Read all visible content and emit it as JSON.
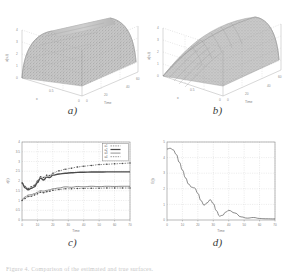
{
  "figure": {
    "background": "#ffffff",
    "caption": "Figure 4. Comparison of the estimated and true surfaces.",
    "panels": [
      "a)",
      "b)",
      "c)",
      "d)"
    ]
  },
  "colors": {
    "axis": "#8a8a8a",
    "grid": "#c9c9c9",
    "surface_dark": "#6e6e6e",
    "surface_light": "#b5b5b5",
    "mesh": "#555555",
    "curve": "#4a4a4a",
    "text": "#5a5a5a"
  },
  "chart_data": [
    {
      "id": "a",
      "type": "surface",
      "label": "a)",
      "title": "",
      "xlabel": "x",
      "ylabel": "Time",
      "zlabel": "u(x,t)",
      "xlim": [
        0,
        1
      ],
      "ylim": [
        0,
        60
      ],
      "zlim": [
        0,
        4
      ],
      "xticks": [
        "0",
        "0.5",
        "1"
      ],
      "yticks": [
        "0",
        "20",
        "40",
        "60"
      ],
      "zticks": [
        "0",
        "1",
        "2",
        "3",
        "4"
      ],
      "grid": true,
      "render": "shaded-noisy-surface",
      "description": "Rough speckled ridge surface, arch shaped along x, flat along time"
    },
    {
      "id": "b",
      "type": "surface",
      "label": "b)",
      "title": "",
      "xlabel": "x",
      "ylabel": "Time",
      "zlabel": "u(x,t)",
      "xlim": [
        0,
        1
      ],
      "ylim": [
        0,
        60
      ],
      "zlim": [
        0,
        4
      ],
      "xticks": [
        "0",
        "0.5",
        "1"
      ],
      "yticks": [
        "0",
        "20",
        "40",
        "60"
      ],
      "zticks": [
        "0",
        "1",
        "2",
        "3",
        "4"
      ],
      "grid": true,
      "render": "wireframe-surface",
      "description": "Smooth mesh surface rising from zero near the origin to a rounded ridge"
    },
    {
      "id": "c",
      "type": "line",
      "label": "c)",
      "title": "",
      "xlabel": "Time",
      "ylabel": "a(t)",
      "xlim": [
        0,
        70
      ],
      "ylim": [
        0,
        4
      ],
      "xticks": [
        0,
        10,
        20,
        30,
        40,
        50,
        60,
        70
      ],
      "yticks": [
        0,
        0.5,
        1,
        1.5,
        2,
        2.5,
        3,
        3.5,
        4
      ],
      "grid": true,
      "legend_position": "top-right",
      "legend": [
        "a1",
        "a2",
        "a3",
        "a4"
      ],
      "series": [
        {
          "name": "a1",
          "style": "marker-dotted",
          "x": [
            0,
            2,
            4,
            6,
            8,
            10,
            12,
            14,
            16,
            18,
            20,
            24,
            28,
            32,
            36,
            40,
            45,
            50,
            55,
            60,
            65,
            70
          ],
          "values": [
            1.9,
            1.72,
            1.62,
            1.7,
            1.78,
            2.0,
            2.22,
            2.18,
            2.3,
            2.28,
            2.4,
            2.52,
            2.6,
            2.66,
            2.72,
            2.76,
            2.8,
            2.84,
            2.86,
            2.88,
            2.9,
            2.92
          ]
        },
        {
          "name": "a2",
          "style": "thick-solid",
          "x": [
            0,
            2,
            4,
            6,
            8,
            10,
            12,
            14,
            16,
            18,
            20,
            24,
            28,
            32,
            36,
            40,
            45,
            50,
            55,
            60,
            65,
            70
          ],
          "values": [
            1.9,
            1.65,
            1.55,
            1.62,
            1.7,
            1.92,
            2.15,
            2.05,
            2.2,
            2.18,
            2.3,
            2.36,
            2.4,
            2.42,
            2.44,
            2.45,
            2.46,
            2.46,
            2.47,
            2.47,
            2.47,
            2.47
          ]
        },
        {
          "name": "a3",
          "style": "thin-solid",
          "x": [
            0,
            2,
            4,
            6,
            8,
            10,
            12,
            14,
            16,
            18,
            20,
            24,
            28,
            32,
            36,
            40,
            45,
            50,
            55,
            60,
            65,
            70
          ],
          "values": [
            1.05,
            1.18,
            1.28,
            1.3,
            1.35,
            1.42,
            1.5,
            1.48,
            1.52,
            1.55,
            1.6,
            1.64,
            1.7,
            1.68,
            1.72,
            1.7,
            1.73,
            1.71,
            1.73,
            1.72,
            1.73,
            1.73
          ]
        },
        {
          "name": "a4",
          "style": "marker-dotted",
          "x": [
            0,
            2,
            4,
            6,
            8,
            10,
            12,
            14,
            16,
            18,
            20,
            24,
            28,
            32,
            36,
            40,
            45,
            50,
            55,
            60,
            65,
            70
          ],
          "values": [
            1.0,
            1.1,
            1.2,
            1.22,
            1.28,
            1.34,
            1.42,
            1.4,
            1.45,
            1.48,
            1.52,
            1.56,
            1.6,
            1.6,
            1.62,
            1.62,
            1.63,
            1.63,
            1.64,
            1.64,
            1.64,
            1.64
          ]
        }
      ]
    },
    {
      "id": "d",
      "type": "line",
      "label": "d)",
      "title": "",
      "xlabel": "Time",
      "ylabel": "E(t)",
      "xlim": [
        0,
        70
      ],
      "ylim": [
        0,
        5
      ],
      "xticks": [
        0,
        10,
        20,
        30,
        40,
        50,
        60,
        70
      ],
      "yticks": [
        0,
        1,
        2,
        3,
        4,
        5
      ],
      "grid": true,
      "series": [
        {
          "name": "E",
          "style": "thin-solid",
          "x": [
            0,
            2,
            4,
            6,
            8,
            10,
            12,
            14,
            16,
            18,
            20,
            22,
            24,
            26,
            28,
            30,
            32,
            34,
            36,
            38,
            40,
            44,
            48,
            52,
            56,
            60,
            64,
            70
          ],
          "values": [
            4.55,
            4.6,
            4.5,
            4.2,
            3.7,
            3.2,
            2.7,
            2.3,
            2.1,
            2.05,
            1.7,
            1.25,
            0.95,
            1.1,
            1.3,
            1.05,
            0.6,
            0.25,
            0.3,
            0.5,
            0.62,
            0.45,
            0.2,
            0.12,
            0.16,
            0.1,
            0.08,
            0.07
          ]
        }
      ]
    }
  ]
}
